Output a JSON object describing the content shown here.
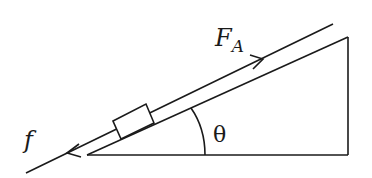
{
  "diagram": {
    "labels": {
      "applied_force": "F",
      "applied_force_subscript": "A",
      "friction": "f",
      "angle": "θ"
    },
    "colors": {
      "stroke": "#1a1a1a",
      "background": "#ffffff"
    }
  }
}
